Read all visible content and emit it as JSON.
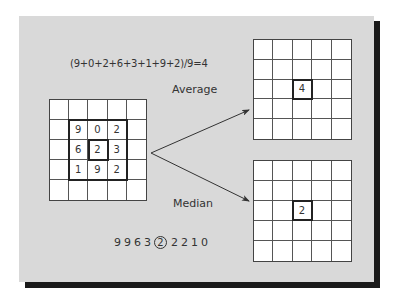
{
  "diagram": {
    "formula": "(9+0+2+6+3+1+9+2)/9=4",
    "average_label": "Average",
    "median_label": "Median",
    "sorted_values": [
      "9",
      "9",
      "6",
      "3",
      "2",
      "2",
      "2",
      "1",
      "0"
    ],
    "median_index": 4,
    "input_grid": {
      "size": 5,
      "neighborhood": [
        [
          "9",
          "0",
          "2"
        ],
        [
          "6",
          "2",
          "3"
        ],
        [
          "1",
          "9",
          "2"
        ]
      ],
      "center_value": "2"
    },
    "average_grid": {
      "size": 5,
      "center_value": "4"
    },
    "median_grid": {
      "size": 5,
      "center_value": "2"
    },
    "colors": {
      "panel": "#d9d9d9",
      "shadow": "#1a1a1a",
      "grid_fill": "#ffffff",
      "line": "#444444"
    }
  }
}
